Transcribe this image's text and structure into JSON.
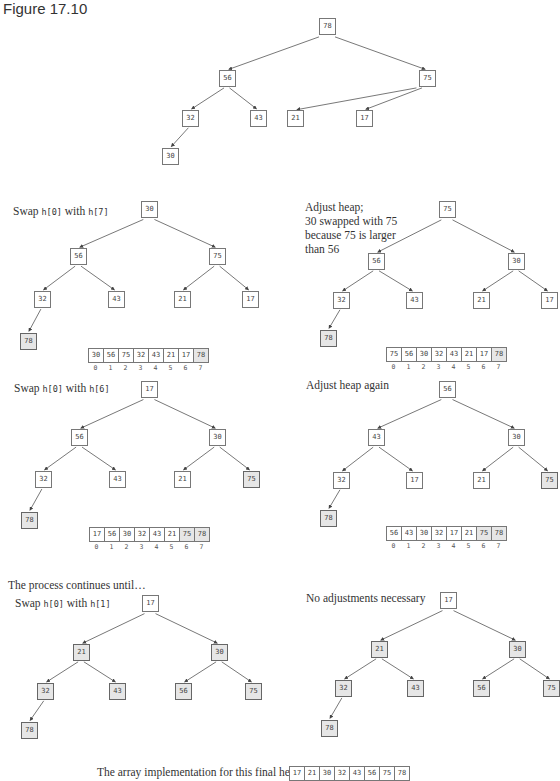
{
  "figure_title": "Figure 17.10",
  "panels": [
    {
      "id": "p0",
      "caption": [],
      "ox": 186,
      "oy": 18,
      "nodes": [
        {
          "v": "78",
          "x": 133,
          "y": 0
        },
        {
          "v": "56",
          "x": 33,
          "y": 52
        },
        {
          "v": "75",
          "x": 233,
          "y": 52
        },
        {
          "v": "32",
          "x": -4,
          "y": 92
        },
        {
          "v": "43",
          "x": 64,
          "y": 92
        },
        {
          "v": "21",
          "x": 101,
          "y": 92
        },
        {
          "v": "17",
          "x": 170,
          "y": 92
        },
        {
          "v": "30",
          "x": -24,
          "y": 130
        }
      ],
      "done": [],
      "array": null
    },
    {
      "id": "p1",
      "caption": [
        {
          "t": "Swap "
        },
        {
          "c": "h[0]"
        },
        {
          "t": " with "
        },
        {
          "c": "h[7]"
        }
      ],
      "capx": 13,
      "capy": 204,
      "ox": 20,
      "oy": 201,
      "nodes": [
        {
          "v": "30",
          "x": 121,
          "y": 0
        },
        {
          "v": "56",
          "x": 50,
          "y": 47
        },
        {
          "v": "75",
          "x": 189,
          "y": 47
        },
        {
          "v": "32",
          "x": 14,
          "y": 90
        },
        {
          "v": "43",
          "x": 88,
          "y": 90
        },
        {
          "v": "21",
          "x": 154,
          "y": 90
        },
        {
          "v": "17",
          "x": 222,
          "y": 90
        },
        {
          "v": "78",
          "x": 0,
          "y": 132
        }
      ],
      "done": [
        "78"
      ],
      "array": {
        "values": [
          "30",
          "56",
          "75",
          "32",
          "43",
          "21",
          "17",
          "78"
        ],
        "done_from": 7,
        "x": 89,
        "y": 348
      }
    },
    {
      "id": "p2",
      "caption": [
        {
          "t": "Adjust heap;"
        },
        {
          "br": 1
        },
        {
          "t": "30 swapped with 75"
        },
        {
          "br": 1
        },
        {
          "t": "because 75 is larger"
        },
        {
          "br": 1
        },
        {
          "t": "than 56"
        }
      ],
      "capx": 305,
      "capy": 200,
      "ox": 320,
      "oy": 201,
      "nodes": [
        {
          "v": "75",
          "x": 119,
          "y": 0
        },
        {
          "v": "56",
          "x": 48,
          "y": 52
        },
        {
          "v": "30",
          "x": 188,
          "y": 52
        },
        {
          "v": "32",
          "x": 13,
          "y": 91
        },
        {
          "v": "43",
          "x": 86,
          "y": 91
        },
        {
          "v": "21",
          "x": 153,
          "y": 91
        },
        {
          "v": "17",
          "x": 221,
          "y": 91
        },
        {
          "v": "78",
          "x": 0,
          "y": 129
        }
      ],
      "done": [
        "78"
      ],
      "array": {
        "values": [
          "75",
          "56",
          "30",
          "32",
          "43",
          "21",
          "17",
          "78"
        ],
        "done_from": 7,
        "x": 387,
        "y": 347
      }
    },
    {
      "id": "p3",
      "caption": [
        {
          "t": "Swap "
        },
        {
          "c": "h[0]"
        },
        {
          "t": " with "
        },
        {
          "c": "h[6]"
        }
      ],
      "capx": 14,
      "capy": 381,
      "ox": 21,
      "oy": 381,
      "nodes": [
        {
          "v": "17",
          "x": 120,
          "y": 0
        },
        {
          "v": "56",
          "x": 50,
          "y": 48
        },
        {
          "v": "30",
          "x": 188,
          "y": 48
        },
        {
          "v": "32",
          "x": 14,
          "y": 90
        },
        {
          "v": "43",
          "x": 88,
          "y": 90
        },
        {
          "v": "21",
          "x": 153,
          "y": 90
        },
        {
          "v": "75",
          "x": 222,
          "y": 90
        },
        {
          "v": "78",
          "x": 0,
          "y": 131
        }
      ],
      "done": [
        "78",
        "75"
      ],
      "array": {
        "values": [
          "17",
          "56",
          "30",
          "32",
          "43",
          "21",
          "75",
          "78"
        ],
        "done_from": 6,
        "x": 90,
        "y": 527
      }
    },
    {
      "id": "p4",
      "caption": [
        {
          "t": "Adjust heap again"
        }
      ],
      "capx": 306,
      "capy": 378,
      "ox": 320,
      "oy": 381,
      "nodes": [
        {
          "v": "56",
          "x": 119,
          "y": 0
        },
        {
          "v": "43",
          "x": 48,
          "y": 48
        },
        {
          "v": "30",
          "x": 188,
          "y": 48
        },
        {
          "v": "32",
          "x": 13,
          "y": 91
        },
        {
          "v": "17",
          "x": 86,
          "y": 91
        },
        {
          "v": "21",
          "x": 153,
          "y": 91
        },
        {
          "v": "75",
          "x": 221,
          "y": 91
        },
        {
          "v": "78",
          "x": 0,
          "y": 129
        }
      ],
      "done": [
        "78",
        "75"
      ],
      "array": {
        "values": [
          "56",
          "43",
          "30",
          "32",
          "17",
          "21",
          "75",
          "78"
        ],
        "done_from": 6,
        "x": 387,
        "y": 526
      }
    },
    {
      "id": "p5",
      "caption": [
        {
          "t": "The process continues until…"
        }
      ],
      "capx": 8,
      "capy": 578,
      "ox": 20,
      "oy": 595,
      "nodes": [
        {
          "v": "17",
          "x": 122,
          "y": 0
        },
        {
          "v": "21",
          "x": 53,
          "y": 49
        },
        {
          "v": "30",
          "x": 191,
          "y": 49
        },
        {
          "v": "32",
          "x": 17,
          "y": 88
        },
        {
          "v": "43",
          "x": 89,
          "y": 88
        },
        {
          "v": "56",
          "x": 155,
          "y": 88
        },
        {
          "v": "75",
          "x": 225,
          "y": 88
        },
        {
          "v": "78",
          "x": 1,
          "y": 127
        }
      ],
      "done": [
        "21",
        "30",
        "32",
        "43",
        "56",
        "75",
        "78"
      ],
      "array": null,
      "subcaption": [
        {
          "t": "Swap "
        },
        {
          "c": "h[0]"
        },
        {
          "t": " with "
        },
        {
          "c": "h[1]"
        }
      ],
      "subx": 15,
      "suby": 596
    },
    {
      "id": "p6",
      "caption": [
        {
          "t": "No adjustments necessary"
        }
      ],
      "capx": 306,
      "capy": 591,
      "ox": 321,
      "oy": 592,
      "nodes": [
        {
          "v": "17",
          "x": 119,
          "y": 0
        },
        {
          "v": "21",
          "x": 50,
          "y": 49
        },
        {
          "v": "30",
          "x": 188,
          "y": 49
        },
        {
          "v": "32",
          "x": 14,
          "y": 88
        },
        {
          "v": "43",
          "x": 86,
          "y": 88
        },
        {
          "v": "56",
          "x": 152,
          "y": 88
        },
        {
          "v": "75",
          "x": 222,
          "y": 88
        },
        {
          "v": "78",
          "x": 0,
          "y": 128
        }
      ],
      "done": [
        "21",
        "30",
        "32",
        "43",
        "56",
        "75",
        "78"
      ],
      "array": null
    }
  ],
  "final": {
    "label": "The array implementation for this final heap is:",
    "values": [
      "17",
      "21",
      "30",
      "32",
      "43",
      "56",
      "75",
      "78"
    ],
    "x": 290,
    "y": 766,
    "labelx": 97,
    "labely": 765
  },
  "edges_parent_index": [
    null,
    0,
    0,
    1,
    1,
    2,
    2,
    3
  ],
  "colors": {
    "border": "#777777",
    "done_fill": "#e6e6e6",
    "edge": "#555555"
  }
}
